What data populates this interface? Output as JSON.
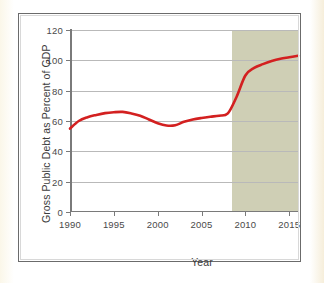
{
  "chart_data": {
    "type": "line",
    "title": "",
    "xlabel": "Year",
    "ylabel": "Gross Public Debt as Percent of GDP",
    "xlim": [
      1990,
      2016
    ],
    "ylim": [
      0,
      120
    ],
    "grid": true,
    "legend": null,
    "x_ticks": [
      "1990",
      "1995",
      "2000",
      "2005",
      "2010",
      "2015"
    ],
    "x_tick_values": [
      1990,
      1995,
      2000,
      2005,
      2010,
      2015
    ],
    "y_ticks": [
      "0",
      "20",
      "40",
      "60",
      "80",
      "100",
      "120"
    ],
    "y_tick_values": [
      0,
      20,
      40,
      60,
      80,
      100,
      120
    ],
    "series": [
      {
        "name": "Gross Public Debt as Percent of GDP",
        "color": "#d32020",
        "x": [
          1990,
          1991,
          1992,
          1993,
          1994,
          1995,
          1996,
          1997,
          1998,
          1999,
          2000,
          2001,
          2002,
          2003,
          2004,
          2005,
          2006,
          2007,
          2008,
          2009,
          2010,
          2011,
          2012,
          2013,
          2014,
          2015,
          2016
        ],
        "values": [
          55,
          60,
          62.5,
          64,
          65.2,
          65.8,
          66,
          65,
          63.5,
          61,
          58.5,
          57,
          57.2,
          59.5,
          61,
          62,
          62.8,
          63.5,
          65,
          76,
          90,
          95,
          97.5,
          99.5,
          101,
          102,
          103
        ]
      }
    ],
    "shaded_region": {
      "name": "projection-band",
      "x_start": 2008.5,
      "x_end": 2016,
      "color": "#ccccb1",
      "label": ""
    }
  },
  "figure": {
    "frame_color": "#6b6b6b",
    "background": "#ffffff",
    "page_background": "#fdfbf2",
    "gridline_color": "#b9b9b9",
    "axis_color": "#7a7a7a"
  }
}
